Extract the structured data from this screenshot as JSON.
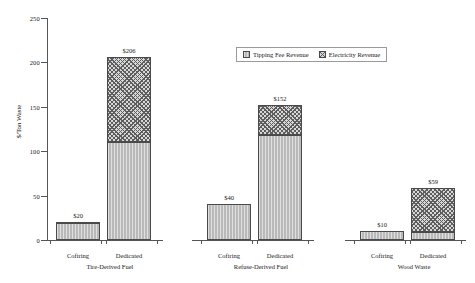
{
  "chart_data": {
    "type": "bar",
    "stacked": true,
    "title": "",
    "xlabel": "",
    "ylabel": "$/Ton Waste",
    "ylim": [
      0,
      250
    ],
    "yticks": [
      0,
      50,
      100,
      150,
      200,
      250
    ],
    "grid": false,
    "legend": {
      "position": "top-right",
      "entries": [
        {
          "name": "Tipping Fee Revenue",
          "pattern": "solid-gray"
        },
        {
          "name": "Electricity Revenue",
          "pattern": "cross-hatch"
        }
      ]
    },
    "groups": [
      {
        "name": "Tire-Derived Fuel",
        "categories": [
          "Cofiring",
          "Dedicated"
        ]
      },
      {
        "name": "Refuse-Derived Fuel",
        "categories": [
          "Cofiring",
          "Dedicated"
        ]
      },
      {
        "name": "Wood Waste",
        "categories": [
          "Cofiring",
          "Dedicated"
        ]
      }
    ],
    "categories": [
      "Tire-Derived Fuel / Cofiring",
      "Tire-Derived Fuel / Dedicated",
      "Refuse-Derived Fuel / Cofiring",
      "Refuse-Derived Fuel / Dedicated",
      "Wood Waste / Cofiring",
      "Wood Waste / Dedicated"
    ],
    "series": [
      {
        "name": "Tipping Fee Revenue",
        "values": [
          19,
          110,
          40,
          118,
          10,
          9
        ]
      },
      {
        "name": "Electricity Revenue",
        "values": [
          1,
          96,
          0,
          34,
          0,
          50
        ]
      }
    ],
    "totals": [
      20,
      206,
      40,
      152,
      10,
      59
    ],
    "data_labels": [
      "$20",
      "$206",
      "$40",
      "$152",
      "$10",
      "$59"
    ]
  },
  "axis": {
    "y_title": "$/Ton Waste",
    "y_tick_labels": [
      "0",
      "50",
      "100",
      "150",
      "200",
      "250"
    ]
  },
  "legend": {
    "tipping_label": "Tipping Fee Revenue",
    "electricity_label": "Electricity Revenue"
  },
  "x_axis": {
    "bar_labels": [
      "Cofiring",
      "Dedicated",
      "Cofiring",
      "Dedicated",
      "Cofiring",
      "Dedicated"
    ],
    "group_labels": [
      "Tire-Derived Fuel",
      "Refuse-Derived Fuel",
      "Wood Waste"
    ]
  }
}
